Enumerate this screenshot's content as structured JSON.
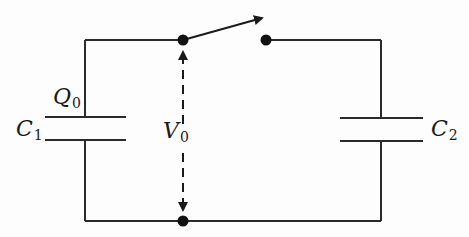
{
  "diagram": {
    "type": "circuit",
    "colors": {
      "wire": "#2a2a2a",
      "background": "#fdfdfd"
    },
    "labels": {
      "c1": {
        "main": "C",
        "sub": "1"
      },
      "q0": {
        "main": "Q",
        "sub": "0"
      },
      "v0": {
        "main": "V",
        "sub": "0"
      },
      "c2": {
        "main": "C",
        "sub": "2"
      }
    },
    "components": [
      {
        "id": "C1",
        "kind": "capacitor",
        "side": "left",
        "charge": "Q0"
      },
      {
        "id": "C2",
        "kind": "capacitor",
        "side": "right"
      },
      {
        "id": "S",
        "kind": "switch",
        "state": "open",
        "position": "top"
      },
      {
        "id": "V0",
        "kind": "voltage-indicator",
        "style": "dashed double arrow",
        "between": "top junction and bottom junction"
      }
    ]
  }
}
